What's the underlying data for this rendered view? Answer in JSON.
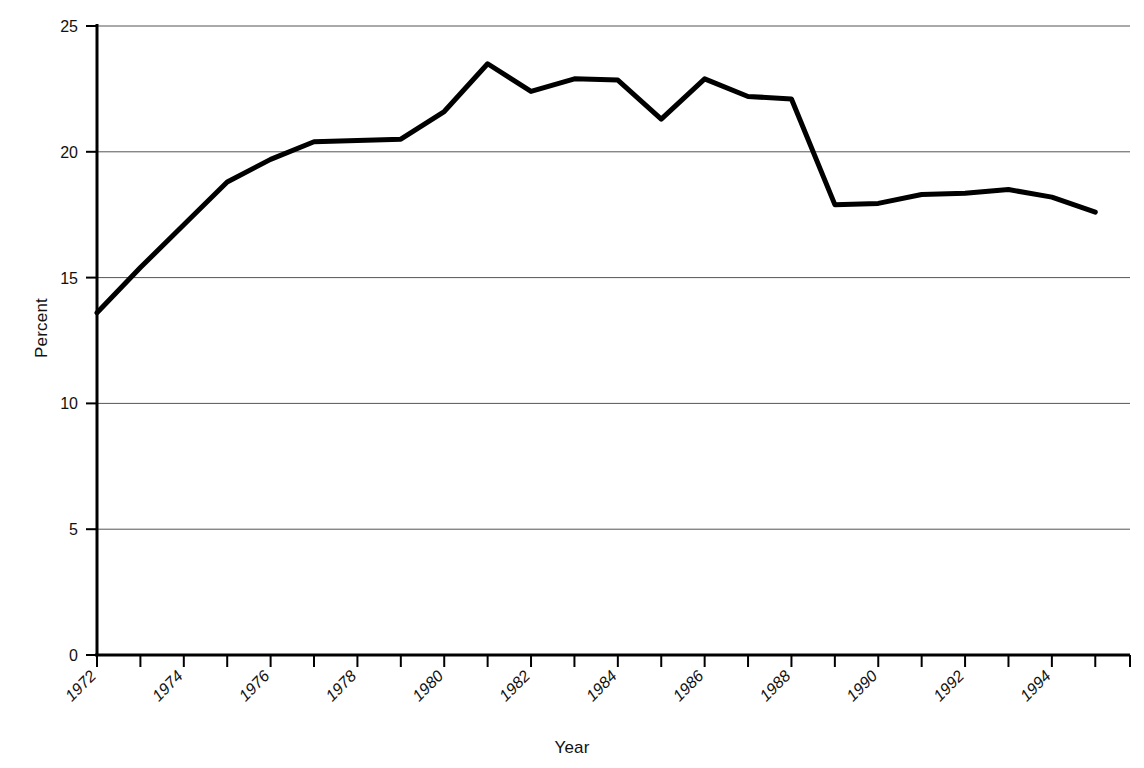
{
  "chart_data": {
    "type": "line",
    "title": "",
    "xlabel": "Year",
    "ylabel": "Percent",
    "xlim": [
      1972,
      1995.8
    ],
    "ylim": [
      0,
      25
    ],
    "ytick_values": [
      0,
      5,
      10,
      15,
      20,
      25
    ],
    "ytick_labels": [
      "0",
      "5",
      "10",
      "15",
      "20",
      "25"
    ],
    "xtick_values": [
      1972,
      1973,
      1974,
      1975,
      1976,
      1977,
      1978,
      1979,
      1980,
      1981,
      1982,
      1983,
      1984,
      1985,
      1986,
      1987,
      1988,
      1989,
      1990,
      1991,
      1992,
      1993,
      1994,
      1995
    ],
    "xtick_labels": [
      "1972",
      "",
      "1974",
      "",
      "1976",
      "",
      "1978",
      "",
      "1980",
      "",
      "1982",
      "",
      "1984",
      "",
      "1986",
      "",
      "1988",
      "",
      "1990",
      "",
      "1992",
      "",
      "1994",
      ""
    ],
    "grid": "horizontal",
    "legend": "none",
    "line_color": "#000000",
    "grid_color": "#555555",
    "axis_color": "#000000",
    "x": [
      1972,
      1973,
      1974,
      1975,
      1976,
      1977,
      1978,
      1979,
      1980,
      1981,
      1982,
      1983,
      1984,
      1985,
      1986,
      1987,
      1988,
      1989,
      1990,
      1991,
      1992,
      1993,
      1994,
      1995
    ],
    "values": [
      13.6,
      15.4,
      17.1,
      18.8,
      19.7,
      20.4,
      20.45,
      20.5,
      21.6,
      23.5,
      22.4,
      22.9,
      22.85,
      21.3,
      22.9,
      22.2,
      22.1,
      17.9,
      17.95,
      18.3,
      18.35,
      18.5,
      18.2,
      17.6
    ],
    "series": [
      {
        "name": "Percent",
        "values": [
          13.6,
          15.4,
          17.1,
          18.8,
          19.7,
          20.4,
          20.45,
          20.5,
          21.6,
          23.5,
          22.4,
          22.9,
          22.85,
          21.3,
          22.9,
          22.2,
          22.1,
          17.9,
          17.95,
          18.3,
          18.35,
          18.5,
          18.2,
          17.6
        ]
      }
    ]
  }
}
